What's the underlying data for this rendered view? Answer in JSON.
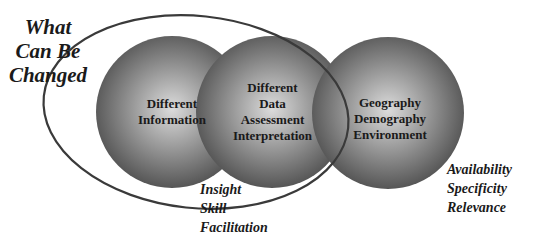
{
  "diagram": {
    "title_label": [
      "What",
      "Can Be",
      "Changed"
    ],
    "circles": [
      {
        "id": "information",
        "lines": [
          "Different",
          "Information"
        ]
      },
      {
        "id": "data",
        "lines": [
          "Different",
          "Data",
          "Assessment",
          "Interpretation"
        ]
      },
      {
        "id": "context",
        "lines": [
          "Geography",
          "Demography",
          "Environment"
        ]
      }
    ],
    "bottom_label": [
      "Insight",
      "Skill",
      "Facilitation"
    ],
    "right_label": [
      "Availability",
      "Specificity",
      "Relevance"
    ],
    "colors": {
      "circle_center": "#d8d8d8",
      "circle_edge": "#4a4a4a",
      "ellipse_stroke": "#3a3a3a",
      "text": "#1a1a1a"
    }
  }
}
